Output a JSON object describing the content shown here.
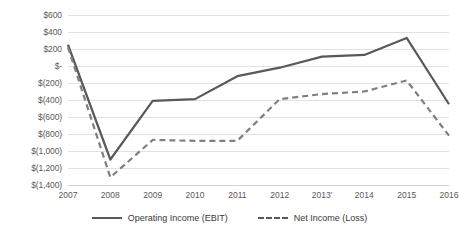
{
  "chart_data": {
    "type": "line",
    "title": "",
    "xlabel": "",
    "ylabel": "",
    "grid": "horizontal",
    "legend_position": "bottom-center",
    "ylim": [
      -1400,
      600
    ],
    "ytick_step": 200,
    "categories": [
      "2007",
      "2008",
      "2009",
      "2010",
      "2011",
      "2012",
      "2013'",
      "2014",
      "2015",
      "2016"
    ],
    "ytick_labels": [
      "$600",
      "$400",
      "$200",
      "$-",
      "$(200)",
      "$(400)",
      "$(600)",
      "$(800)",
      "$(1,000)",
      "$(1,200)",
      "$(1,400)"
    ],
    "ytick_values": [
      600,
      400,
      200,
      0,
      -200,
      -400,
      -600,
      -800,
      -1000,
      -1200,
      -1400
    ],
    "series": [
      {
        "name": "Operating Income (EBIT)",
        "style": "solid",
        "color": "#595959",
        "values": [
          250,
          -1100,
          -410,
          -390,
          -120,
          -20,
          110,
          130,
          330,
          -450
        ]
      },
      {
        "name": "Net Income (Loss)",
        "style": "dashed",
        "color": "#7f7f7f",
        "values": [
          220,
          -1310,
          -870,
          -880,
          -880,
          -390,
          -330,
          -300,
          -170,
          -820
        ]
      }
    ]
  },
  "legend": {
    "items": [
      {
        "label": "Operating Income (EBIT)",
        "style": "solid"
      },
      {
        "label": "Net Income (Loss)",
        "style": "dashed"
      }
    ]
  },
  "colors": {
    "series_solid": "#595959",
    "series_dashed": "#7f7f7f",
    "gridline": "#e2e2e2",
    "axis_text": "#595959",
    "background": "#ffffff"
  }
}
